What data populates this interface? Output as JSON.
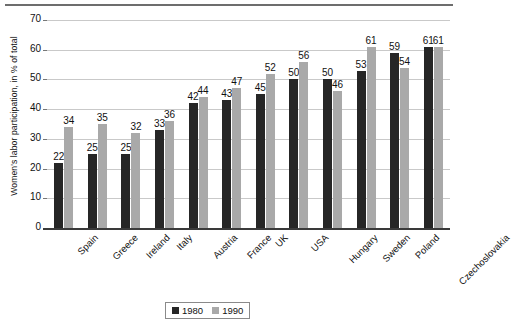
{
  "chart_data": {
    "type": "bar",
    "title": "",
    "xlabel": "",
    "ylabel": "Women's labor participation, in % of total",
    "ylim": [
      0,
      70
    ],
    "yticks": [
      0,
      10,
      20,
      30,
      40,
      50,
      60,
      70
    ],
    "grid": true,
    "legend_position": "bottom-center",
    "categories": [
      "Spain",
      "Greece",
      "Ireland",
      "Italy",
      "Austria",
      "France",
      "UK",
      "USA",
      "Hungary",
      "Sweden",
      "Poland",
      "Czechoslovakia"
    ],
    "series": [
      {
        "name": "1980",
        "color": "#262626",
        "values": [
          22,
          25,
          25,
          33,
          42,
          43,
          45,
          50,
          50,
          53,
          59,
          61
        ]
      },
      {
        "name": "1990",
        "color": "#a9a9a9",
        "values": [
          34,
          35,
          32,
          36,
          44,
          47,
          52,
          56,
          46,
          61,
          54,
          61
        ]
      }
    ]
  },
  "legend": {
    "items": [
      {
        "label": "1980",
        "color": "#262626"
      },
      {
        "label": "1990",
        "color": "#a9a9a9"
      }
    ]
  },
  "axis": {
    "y_title": "Women's labor participation, in % of total"
  }
}
